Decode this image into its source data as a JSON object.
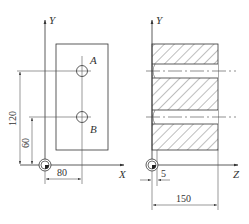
{
  "diagram": {
    "front_view": {
      "axes": {
        "vertical": "Y",
        "horizontal": "X"
      },
      "holes": [
        {
          "label": "A"
        },
        {
          "label": "B"
        }
      ],
      "dimensions": {
        "hole_a_y": "120",
        "hole_b_y": "60",
        "holes_x": "80"
      }
    },
    "side_view": {
      "axes": {
        "vertical": "Y",
        "horizontal": "Z"
      },
      "dimensions": {
        "offset": "5",
        "length": "150"
      }
    }
  }
}
